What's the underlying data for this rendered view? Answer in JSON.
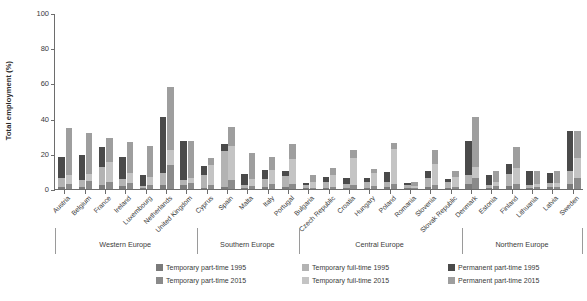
{
  "chart_data": {
    "type": "bar",
    "subtype": "grouped-stacked",
    "title": "",
    "xlabel": "",
    "ylabel": "Total employment (%)",
    "ylim": [
      0,
      100
    ],
    "yticks": [
      0,
      20,
      40,
      60,
      80,
      100
    ],
    "grid": false,
    "legend_position": "bottom",
    "categories": [
      "Austria",
      "Belgium",
      "France",
      "Ireland",
      "Luxembourg",
      "Netherlands",
      "United Kingdom",
      "Cyprus",
      "Spain",
      "Malta",
      "Italy",
      "Portugal",
      "Bulgaria",
      "Czech Republic",
      "Croatia",
      "Hungary",
      "Poland",
      "Romania",
      "Slovenia",
      "Slovak Republic",
      "Denmark",
      "Estonia",
      "Finland",
      "Lithuania",
      "Latvia",
      "Sweden"
    ],
    "groups": [
      {
        "name": "Western Europe",
        "countries": [
          "Austria",
          "Belgium",
          "France",
          "Ireland",
          "Luxembourg",
          "Netherlands",
          "United Kingdom"
        ]
      },
      {
        "name": "Southern Europe",
        "countries": [
          "Cyprus",
          "Spain",
          "Malta",
          "Italy",
          "Portugal"
        ]
      },
      {
        "name": "Central Europe",
        "countries": [
          "Bulgaria",
          "Czech Republic",
          "Croatia",
          "Hungary",
          "Poland",
          "Romania",
          "Slovenia",
          "Slovak Republic"
        ]
      },
      {
        "name": "Northern Europe",
        "countries": [
          "Denmark",
          "Estonia",
          "Finland",
          "Lithuania",
          "Latvia",
          "Sweden"
        ]
      }
    ],
    "series": [
      {
        "name": "Temporary part-time 1995",
        "year": "1995",
        "color": "#7a7a7a",
        "values": [
          1.0,
          1.2,
          2.0,
          1.5,
          0.6,
          2.0,
          2.2,
          0.8,
          1.3,
          0.5,
          0.9,
          1.2,
          0.4,
          0.6,
          0.7,
          0.7,
          1.2,
          0.4,
          1.0,
          0.5,
          3.0,
          0.8,
          1.6,
          0.7,
          0.9,
          3.0
        ]
      },
      {
        "name": "Temporary full-time 1995",
        "year": "1995",
        "color": "#b3b3b3",
        "values": [
          5.0,
          4.2,
          10.5,
          4.2,
          1.0,
          7.2,
          2.8,
          7.0,
          20.5,
          2.0,
          4.8,
          6.0,
          1.6,
          3.4,
          2.0,
          3.3,
          3.0,
          1.8,
          5.0,
          3.5,
          5.0,
          1.2,
          7.0,
          1.8,
          2.4,
          7.5
        ]
      },
      {
        "name": "Permanent part-time 1995",
        "year": "1995",
        "color": "#4a4a4a",
        "values": [
          12.0,
          13.8,
          11.5,
          12.3,
          6.5,
          31.5,
          22.2,
          5.0,
          4.0,
          6.0,
          5.0,
          3.0,
          1.2,
          3.0,
          3.3,
          2.0,
          5.5,
          1.5,
          4.0,
          1.6,
          19.5,
          6.0,
          5.4,
          7.5,
          6.0,
          22.5
        ]
      },
      {
        "name": "Temporary part-time 2015",
        "year": "2015",
        "color": "#8a8a8a",
        "values": [
          3.0,
          4.5,
          4.2,
          3.5,
          2.0,
          13.5,
          3.2,
          2.3,
          5.2,
          1.8,
          3.0,
          3.0,
          0.7,
          1.4,
          2.2,
          1.5,
          2.8,
          0.5,
          2.4,
          1.0,
          6.0,
          1.6,
          3.0,
          1.4,
          1.4,
          6.5
        ]
      },
      {
        "name": "Temporary full-time 2015",
        "year": "2015",
        "color": "#c4c4c4",
        "values": [
          5.2,
          4.0,
          11.0,
          5.5,
          5.0,
          8.5,
          3.0,
          11.2,
          19.5,
          4.0,
          8.0,
          14.0,
          3.2,
          6.4,
          15.5,
          7.5,
          20.0,
          1.0,
          11.6,
          6.0,
          6.5,
          2.4,
          9.0,
          1.6,
          2.2,
          11.0
        ]
      },
      {
        "name": "Permanent part-time 2015",
        "year": "2015",
        "color": "#9e9e9e",
        "values": [
          26.3,
          23.5,
          14.0,
          18.0,
          17.5,
          36.0,
          21.0,
          4.0,
          10.8,
          14.5,
          7.0,
          8.5,
          4.3,
          4.2,
          4.3,
          2.5,
          3.2,
          2.5,
          8.0,
          3.5,
          28.5,
          6.0,
          12.0,
          7.0,
          6.4,
          15.5
        ]
      }
    ],
    "legend_entries": [
      {
        "label": "Temporary part-time 1995",
        "color": "#7a7a7a"
      },
      {
        "label": "Temporary full-time 1995",
        "color": "#b3b3b3"
      },
      {
        "label": "Permanent part-time 1995",
        "color": "#4a4a4a"
      },
      {
        "label": "Temporary part-time 2015",
        "color": "#8a8a8a"
      },
      {
        "label": "Temporary full-time 2015",
        "color": "#c4c4c4"
      },
      {
        "label": "Permanent part-time 2015",
        "color": "#9e9e9e"
      }
    ]
  }
}
